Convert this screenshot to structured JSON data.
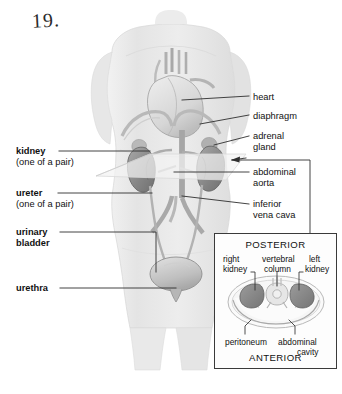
{
  "page": {
    "hand_written_number": "19.",
    "background": "#ffffff"
  },
  "labels_left": [
    {
      "name": "kidney",
      "text": "kidney",
      "sub": "(one of a pair)",
      "bold": true
    },
    {
      "name": "ureter",
      "text": "ureter",
      "sub": "(one of a pair)",
      "bold": true
    },
    {
      "name": "urinary-bladder",
      "text": "urinary",
      "sub": "bladder",
      "bold": true
    },
    {
      "name": "urethra",
      "text": "urethra",
      "sub": "",
      "bold": true
    }
  ],
  "labels_right": [
    {
      "name": "heart",
      "line1": "heart",
      "line2": ""
    },
    {
      "name": "diaphragm",
      "line1": "diaphragm",
      "line2": ""
    },
    {
      "name": "adrenal-gland",
      "line1": "adrenal",
      "line2": "gland"
    },
    {
      "name": "abdominal-aorta",
      "line1": "abdominal",
      "line2": "aorta"
    },
    {
      "name": "inferior-vena-cava",
      "line1": "inferior",
      "line2": "vena cava"
    }
  ],
  "inset": {
    "orientation_top": "POSTERIOR",
    "orientation_bottom": "ANTERIOR",
    "labels": [
      {
        "name": "right-kidney",
        "line1": "right",
        "line2": "kidney"
      },
      {
        "name": "vertebral-column",
        "line1": "vertebral",
        "line2": "column"
      },
      {
        "name": "left-kidney",
        "line1": "left",
        "line2": "kidney"
      },
      {
        "name": "peritoneum",
        "line1": "peritoneum",
        "line2": ""
      },
      {
        "name": "abdominal-cavity",
        "line1": "abdominal",
        "line2": "cavity"
      }
    ],
    "border_color": "#3a3a3a"
  },
  "colors": {
    "ink": "#111111",
    "leader_line": "#2f2f2f",
    "body_fill": "#e9e9e9",
    "organ_dark": "#8d8d8d",
    "organ_mid": "#b4b4b4",
    "organ_light": "#d2d2d2",
    "plane": "#f0f0f0"
  }
}
